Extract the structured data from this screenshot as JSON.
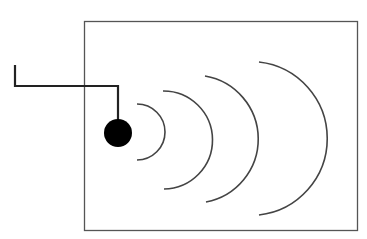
{
  "diagram": {
    "colors": {
      "background": "#ffffff",
      "enclosure": "#555555",
      "wire": "#222222",
      "source": "#000000",
      "waves": "#444444"
    },
    "enclosure": {
      "x": 84,
      "y": 21,
      "width": 273,
      "height": 209
    },
    "wire": {
      "points": [
        [
          15,
          65
        ],
        [
          15,
          86
        ],
        [
          118,
          86
        ],
        [
          118,
          120
        ]
      ]
    },
    "source": {
      "cx": 118,
      "cy": 133,
      "r": 14
    },
    "wave_fronts": [
      {
        "x_start": 137,
        "y_top": 104,
        "y_bottom": 160,
        "x_peak": 163
      },
      {
        "x_start": 163,
        "y_top": 91,
        "y_bottom": 189,
        "x_peak": 205
      },
      {
        "x_start": 205,
        "y_top": 76,
        "y_bottom": 202,
        "x_peak": 258
      },
      {
        "x_start": 259,
        "y_top": 62,
        "y_bottom": 215,
        "x_peak": 327
      }
    ]
  }
}
